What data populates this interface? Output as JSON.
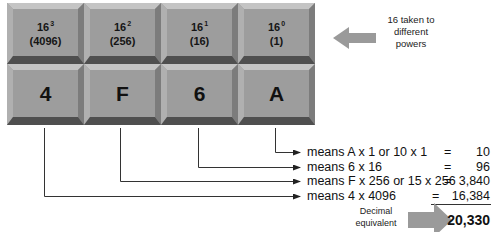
{
  "powers_row": [
    {
      "base": "16",
      "exp": "3",
      "value": "(4096)"
    },
    {
      "base": "16",
      "exp": "2",
      "value": "(256)"
    },
    {
      "base": "16",
      "exp": "1",
      "value": "(16)"
    },
    {
      "base": "16",
      "exp": "0",
      "value": "(1)"
    }
  ],
  "digits_row": [
    "4",
    "F",
    "6",
    "A"
  ],
  "powers_note": {
    "line1": "16 taken to",
    "line2": "different",
    "line3": "powers"
  },
  "explanations": [
    {
      "text": "means A x 1 or 10 x 1",
      "eq": "=",
      "value": "10"
    },
    {
      "text": "means 6 x 16",
      "eq": "=",
      "value": "96"
    },
    {
      "text": "means F x 256 or 15 x 256",
      "eq": "=",
      "value": "3,840"
    },
    {
      "text": "means 4 x 4096",
      "eq": "=",
      "value": "16,384"
    }
  ],
  "result": {
    "label_line1": "Decimal",
    "label_line2": "equivalent",
    "total": "20,330"
  },
  "colors": {
    "key_face": "#9d9d9d",
    "arrow": "#9a9a9a",
    "line": "#333333"
  }
}
